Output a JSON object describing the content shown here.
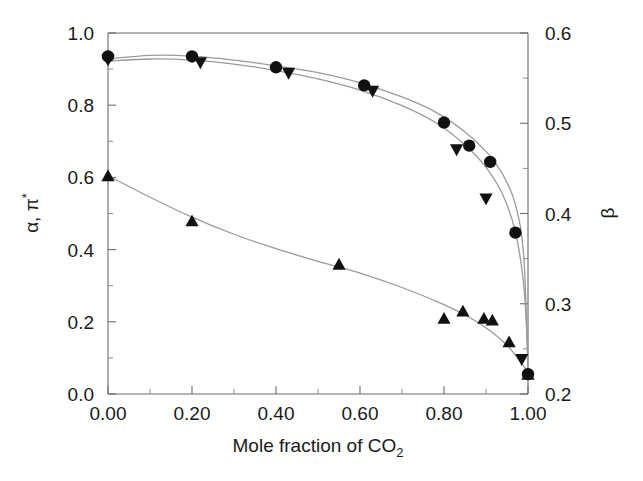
{
  "chart_data": {
    "type": "scatter",
    "title": "",
    "xlabel": "Mole fraction of CO2",
    "xlabel_main": "Mole fraction of CO",
    "xlabel_sub": "2",
    "ylabel_left": "α, π*",
    "ylabel_left_main": "α, π",
    "ylabel_left_sup": "*",
    "ylabel_right": "β",
    "xlim": [
      0.0,
      1.0
    ],
    "ylim_left": [
      0.0,
      1.0
    ],
    "ylim_right": [
      0.2,
      0.6
    ],
    "grid": false,
    "legend": "none",
    "xticks": [
      "0.00",
      "0.20",
      "0.40",
      "0.60",
      "0.80",
      "1.00"
    ],
    "xtick_values": [
      0.0,
      0.2,
      0.4,
      0.6,
      0.8,
      1.0
    ],
    "yticks_left": [
      "0.0",
      "0.2",
      "0.4",
      "0.6",
      "0.8",
      "1.0"
    ],
    "ytick_left_values": [
      0.0,
      0.2,
      0.4,
      0.6,
      0.8,
      1.0
    ],
    "yticks_right": [
      "0.2",
      "0.3",
      "0.4",
      "0.5",
      "0.6"
    ],
    "ytick_right_values": [
      0.2,
      0.3,
      0.4,
      0.5,
      0.6
    ],
    "minor_ticks": true,
    "marker_color": "#111111",
    "curve_color": "#9a9a9a",
    "axis_color": "#6b6b6b",
    "series": [
      {
        "name": "alpha",
        "marker": "circle",
        "axis": "left",
        "x": [
          0.0,
          0.2,
          0.4,
          0.61,
          0.8,
          0.86,
          0.91,
          0.97,
          1.0
        ],
        "values": [
          0.935,
          0.935,
          0.905,
          0.855,
          0.752,
          0.688,
          0.643,
          0.447,
          0.055
        ]
      },
      {
        "name": "pi-star",
        "marker": "triangle-down",
        "axis": "left",
        "x": [
          0.0,
          0.22,
          0.43,
          0.63,
          0.83,
          0.9,
          0.985
        ],
        "values": [
          0.925,
          0.917,
          0.888,
          0.838,
          0.676,
          0.54,
          0.095
        ]
      },
      {
        "name": "beta",
        "marker": "triangle-up",
        "axis": "right",
        "x": [
          0.0,
          0.2,
          0.55,
          0.8,
          0.845,
          0.895,
          0.915,
          0.955,
          1.0
        ],
        "values": [
          0.442,
          0.392,
          0.344,
          0.284,
          0.292,
          0.284,
          0.282,
          0.258,
          0.222
        ]
      }
    ],
    "fit_curves": [
      {
        "name": "alpha-fit",
        "axis": "left",
        "points": [
          [
            0.0,
            0.928
          ],
          [
            0.1,
            0.938
          ],
          [
            0.2,
            0.936
          ],
          [
            0.3,
            0.925
          ],
          [
            0.4,
            0.909
          ],
          [
            0.5,
            0.89
          ],
          [
            0.6,
            0.862
          ],
          [
            0.7,
            0.823
          ],
          [
            0.78,
            0.781
          ],
          [
            0.85,
            0.726
          ],
          [
            0.9,
            0.672
          ],
          [
            0.94,
            0.608
          ],
          [
            0.97,
            0.525
          ],
          [
            0.99,
            0.38
          ],
          [
            1.0,
            0.06
          ]
        ]
      },
      {
        "name": "pi-star-fit",
        "axis": "left",
        "points": [
          [
            0.0,
            0.922
          ],
          [
            0.1,
            0.928
          ],
          [
            0.2,
            0.925
          ],
          [
            0.3,
            0.914
          ],
          [
            0.4,
            0.896
          ],
          [
            0.5,
            0.873
          ],
          [
            0.6,
            0.842
          ],
          [
            0.7,
            0.799
          ],
          [
            0.78,
            0.752
          ],
          [
            0.85,
            0.69
          ],
          [
            0.9,
            0.628
          ],
          [
            0.94,
            0.552
          ],
          [
            0.97,
            0.448
          ],
          [
            0.99,
            0.3
          ],
          [
            1.0,
            0.1
          ]
        ]
      },
      {
        "name": "beta-fit",
        "axis": "right",
        "points": [
          [
            0.0,
            0.442
          ],
          [
            0.1,
            0.418
          ],
          [
            0.2,
            0.396
          ],
          [
            0.3,
            0.377
          ],
          [
            0.4,
            0.361
          ],
          [
            0.5,
            0.347
          ],
          [
            0.6,
            0.334
          ],
          [
            0.7,
            0.318
          ],
          [
            0.8,
            0.299
          ],
          [
            0.86,
            0.285
          ],
          [
            0.91,
            0.27
          ],
          [
            0.95,
            0.254
          ],
          [
            0.98,
            0.237
          ],
          [
            1.0,
            0.224
          ]
        ]
      }
    ]
  },
  "figure": {
    "axes_name": "scatter-plot-axes"
  }
}
